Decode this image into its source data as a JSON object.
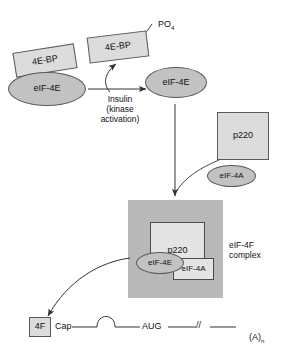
{
  "diagram": {
    "nodes": {
      "bound_4ebp": {
        "label": "4E-BP"
      },
      "bound_eif4e": {
        "label": "eIF-4E"
      },
      "released_4ebp": {
        "label": "4E-BP"
      },
      "phosphate": {
        "label": "PO",
        "subscript": "4"
      },
      "free_eif4e": {
        "label": "eIF-4E"
      },
      "p220_free": {
        "label": "p220"
      },
      "eif4a_free": {
        "label": "eIF-4A"
      },
      "p220_complex": {
        "label": "p220"
      },
      "eif4e_complex": {
        "label": "eIF-4E"
      },
      "eif4a_complex": {
        "label": "eIF-4A"
      },
      "four_f_box": {
        "label": "4F"
      }
    },
    "annotations": {
      "insulin": "Insulin\n(kinase\nactivation)",
      "complex_label": "eIF-4F\ncomplex"
    },
    "mrna": {
      "cap": "Cap",
      "start_codon": "AUG",
      "break_marker": "//",
      "poly_a": "(A)",
      "poly_a_subscript": "n"
    },
    "colors": {
      "box_fill": "#dcdcdc",
      "ellipse_fill": "#c2c2c2",
      "complex_bg": "#b9b9b9",
      "inner_box_fill": "#e4e4e4",
      "stroke": "#4a4a4a",
      "text": "#111111"
    }
  }
}
